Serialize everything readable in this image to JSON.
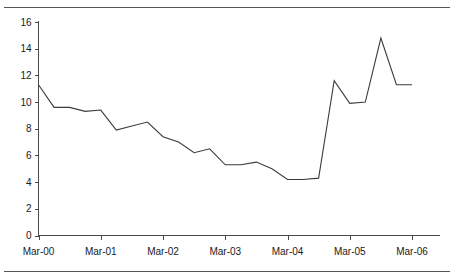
{
  "chart_data": {
    "type": "line",
    "title": "",
    "subtitle": "",
    "xlabel": "",
    "ylabel": "",
    "ylim": [
      0,
      16
    ],
    "y_ticks": [
      0,
      2,
      4,
      6,
      8,
      10,
      12,
      14,
      16
    ],
    "x_tick_labels": [
      "Mar-00",
      "Mar-01",
      "Mar-02",
      "Mar-03",
      "Mar-04",
      "Mar-05",
      "Mar-06"
    ],
    "grid": false,
    "legend": null,
    "legend_position": "none",
    "line_color": "#3b3b3b",
    "axis_color": "#4a4a4a",
    "frequency": "quarterly",
    "x": [
      "Mar-00",
      "Jun-00",
      "Sep-00",
      "Dec-00",
      "Mar-01",
      "Jun-01",
      "Sep-01",
      "Dec-01",
      "Mar-02",
      "Jun-02",
      "Sep-02",
      "Dec-02",
      "Mar-03",
      "Jun-03",
      "Sep-03",
      "Dec-03",
      "Mar-04",
      "Jun-04",
      "Sep-04",
      "Dec-04",
      "Mar-05",
      "Jun-05",
      "Sep-05",
      "Dec-05",
      "Mar-06"
    ],
    "values": [
      11.3,
      9.6,
      9.6,
      9.3,
      9.4,
      7.9,
      8.2,
      8.5,
      7.4,
      7.0,
      6.2,
      6.5,
      5.3,
      5.3,
      5.5,
      5.0,
      4.2,
      4.2,
      4.3,
      11.6,
      9.9,
      10.0,
      14.8,
      11.3,
      11.3
    ],
    "series": [
      {
        "name": "series-1",
        "values": [
          11.3,
          9.6,
          9.6,
          9.3,
          9.4,
          7.9,
          8.2,
          8.5,
          7.4,
          7.0,
          6.2,
          6.5,
          5.3,
          5.3,
          5.5,
          5.0,
          4.2,
          4.2,
          4.3,
          11.6,
          9.9,
          10.0,
          14.8,
          11.3,
          11.3
        ]
      }
    ],
    "annotations": []
  }
}
